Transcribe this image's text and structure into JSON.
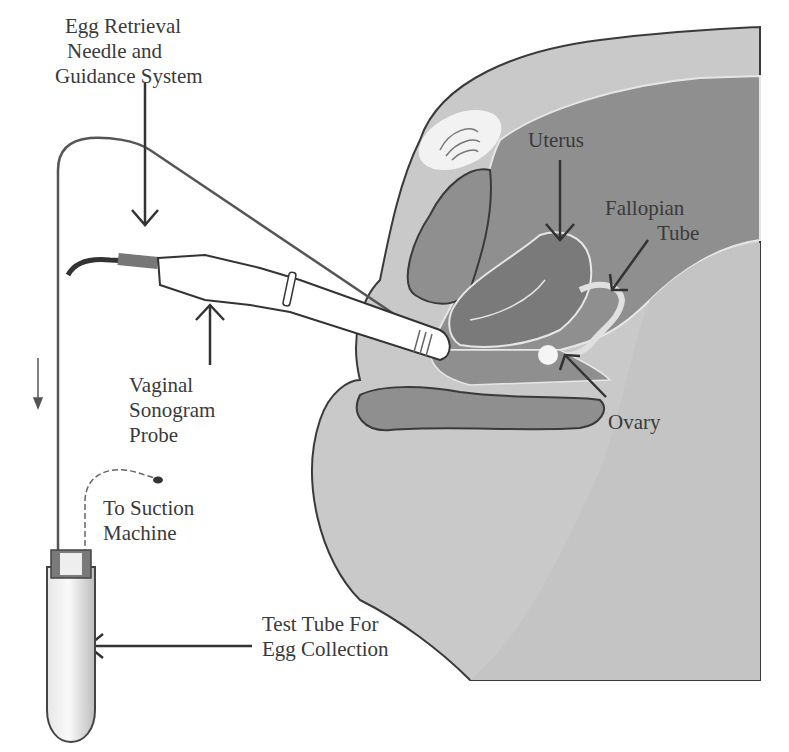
{
  "figure": {
    "type": "anatomical-diagram"
  },
  "labels": {
    "needle": [
      "Egg Retrieval",
      "Needle and",
      "Guidance System"
    ],
    "uterus": [
      "Uterus"
    ],
    "fallopian": [
      "Fallopian",
      "Tube"
    ],
    "probe": [
      "Vaginal",
      "Sonogram",
      "Probe"
    ],
    "ovary": [
      "Ovary"
    ],
    "suction": [
      "To Suction",
      "Machine"
    ],
    "test_tube": [
      "Test Tube For",
      "Egg Collection"
    ]
  },
  "caption": {
    "text": "",
    "note": "caption cut off at image bottom edge; only glyph tops visible"
  },
  "colors": {
    "background": "#ffffff",
    "body_light": "#c9c9c9",
    "organ_mid": "#8f8f8f",
    "organ_dark": "#7a7a7a",
    "outline": "#3a3a3a",
    "text": "#3a3a3a"
  }
}
